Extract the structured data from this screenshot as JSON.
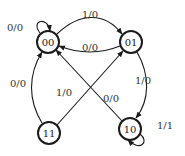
{
  "diagram": {
    "type": "state-machine",
    "states": [
      {
        "id": "00",
        "label": "00"
      },
      {
        "id": "01",
        "label": "01"
      },
      {
        "id": "10",
        "label": "10"
      },
      {
        "id": "11",
        "label": "11"
      }
    ],
    "transitions": [
      {
        "from": "00",
        "to": "00",
        "label": "0/0"
      },
      {
        "from": "00",
        "to": "01",
        "label": "1/0"
      },
      {
        "from": "01",
        "to": "00",
        "label": "0/0"
      },
      {
        "from": "01",
        "to": "10",
        "label": "1/0"
      },
      {
        "from": "10",
        "to": "00",
        "label": "0/0"
      },
      {
        "from": "11",
        "to": "01",
        "label": "1/0"
      },
      {
        "from": "11",
        "to": "00",
        "label": "0/0"
      },
      {
        "from": "10",
        "to": "10",
        "label": "1/1"
      }
    ],
    "colors": {
      "stroke": "#1a1a1a",
      "background": "#ffffff"
    }
  }
}
